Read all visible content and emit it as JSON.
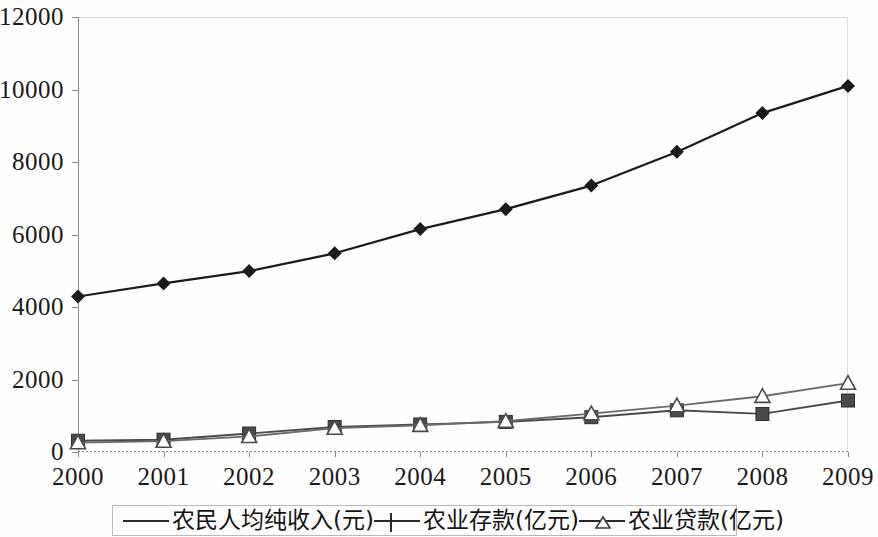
{
  "chart_data": {
    "type": "line",
    "title": "",
    "subtitle": "",
    "xlabel": "",
    "ylabel": "",
    "categories": [
      "2000",
      "2001",
      "2002",
      "2003",
      "2004",
      "2005",
      "2006",
      "2007",
      "2008",
      "2009"
    ],
    "x": [
      2000,
      2001,
      2002,
      2003,
      2004,
      2005,
      2006,
      2007,
      2008,
      2009
    ],
    "ylim": [
      0,
      12000
    ],
    "xlim": [
      2000,
      2009
    ],
    "y_ticks": [
      "0",
      "2000",
      "4000",
      "6000",
      "8000",
      "10000",
      "12000"
    ],
    "y_tick_values": [
      0,
      2000,
      4000,
      6000,
      8000,
      10000,
      12000
    ],
    "grid": false,
    "legend_position": "bottom",
    "series": [
      {
        "name": "农民人均纯收入(元)",
        "marker": "diamond-filled",
        "color": "#1b1b1b",
        "values": [
          4290,
          4650,
          4990,
          5480,
          6150,
          6700,
          7350,
          8280,
          9350,
          10100
        ]
      },
      {
        "name": "农业存款(亿元)",
        "marker": "square-filled",
        "color": "#4a4a4a",
        "values": [
          310,
          340,
          510,
          690,
          760,
          830,
          960,
          1150,
          1050,
          1420
        ]
      },
      {
        "name": "农业贷款(亿元)",
        "marker": "triangle-hollow",
        "color": "#6a6a6a",
        "values": [
          260,
          300,
          430,
          660,
          740,
          850,
          1060,
          1280,
          1540,
          1900
        ]
      }
    ]
  },
  "legend": {
    "items": [
      {
        "label": "农民人均纯收入(元)",
        "icon": "diamond-marker-icon"
      },
      {
        "label": "农业存款(亿元)",
        "icon": "square-marker-icon"
      },
      {
        "label": "农业贷款(亿元)",
        "icon": "triangle-marker-icon"
      }
    ]
  }
}
